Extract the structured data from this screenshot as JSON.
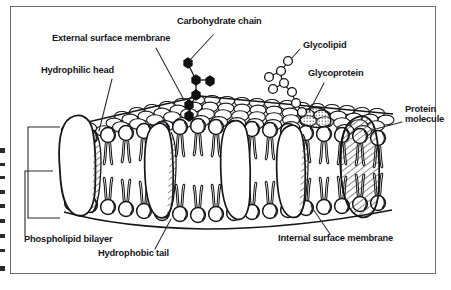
{
  "figure": {
    "type": "labelled-biology-diagram",
    "style": "black-and-white line drawing with cross-hatching, enclosed in a thin rectangular frame"
  },
  "colors": {
    "ink": "#15161a",
    "paper": "#ffffff",
    "frame": "#6d6d70",
    "leader_line": "#2b2b2e",
    "carbohydrate_fill": "#101012",
    "glycolipid_fill": "#ffffff",
    "hatch": "#3a3a3d"
  },
  "labels": [
    {
      "id": "carbohydrate-chain",
      "text": "Carbohydrate chain",
      "x": 177,
      "y": 21,
      "leader": {
        "from": [
          215,
          35
        ],
        "to": [
          189,
          62
        ]
      },
      "points_to": "branched chain of filled black hexagons projecting from the external surface"
    },
    {
      "id": "external-surface-membrane",
      "text": "External surface membrane",
      "x": 52,
      "y": 38,
      "leader": {
        "from": [
          155,
          50
        ],
        "to": [
          182,
          100
        ]
      },
      "points_to": "upper cobbled surface of phospholipid heads"
    },
    {
      "id": "glycolipid",
      "text": "Glycolipid",
      "x": 302,
      "y": 45,
      "leader": {
        "from": [
          300,
          53
        ],
        "to": [
          288,
          62
        ]
      },
      "points_to": "branched chain of open circles attached to a lipid"
    },
    {
      "id": "hydrophilic-head",
      "text": "Hydrophilic head",
      "x": 41,
      "y": 70,
      "leader": {
        "from": [
          110,
          79
        ],
        "to": [
          100,
          132
        ]
      },
      "points_to": "spherical head of a phospholipid in the outer leaflet"
    },
    {
      "id": "glycoprotein",
      "text": "Glycoprotein",
      "x": 307,
      "y": 73,
      "leader": {
        "from": [
          323,
          83
        ],
        "to": [
          304,
          112
        ]
      },
      "points_to": "stippled protein bump on the external surface"
    },
    {
      "id": "protein-molecule",
      "text": "Protein\nmolecule",
      "x": 405,
      "y": 110,
      "leader": {
        "from": [
          403,
          123
        ],
        "to": [
          372,
          132
        ]
      },
      "points_to": "large hatched protein spanning the bilayer at the right edge"
    },
    {
      "id": "phospholipid-bilayer",
      "text": "Phospholipid bilayer",
      "x": 24,
      "y": 239,
      "leader": {
        "from": [
          54,
          238
        ],
        "to": [
          54,
          170
        ]
      },
      "points_to": "bracketed full thickness of the two phospholipid leaflets"
    },
    {
      "id": "hydrophobic-tail",
      "text": "Hydrophobic tail",
      "x": 98,
      "y": 253,
      "leader": {
        "from": [
          156,
          250
        ],
        "to": [
          172,
          218
        ]
      },
      "points_to": "wavy fatty-acid tails in the membrane interior"
    },
    {
      "id": "internal-surface-membrane",
      "text": "Internal surface membrane",
      "x": 278,
      "y": 238,
      "leader": {
        "from": [
          330,
          236
        ],
        "to": [
          310,
          205
        ]
      },
      "points_to": "lower row of phospholipid heads facing the cytoplasm"
    }
  ],
  "structures": {
    "bilayer": {
      "leaflets": 2,
      "head_shape": "sphere with crescent shading",
      "tail_shape": "paired wavy lines"
    },
    "proteins": [
      {
        "id": "protein-left",
        "kind": "intrinsic",
        "position": "left",
        "shading": "outline"
      },
      {
        "id": "protein-mid-a",
        "kind": "intrinsic",
        "position": "centre-left",
        "shading": "outline"
      },
      {
        "id": "protein-mid-b",
        "kind": "intrinsic",
        "position": "centre",
        "shading": "outline"
      },
      {
        "id": "protein-mid-c",
        "kind": "intrinsic",
        "position": "centre-right",
        "shading": "outline"
      },
      {
        "id": "protein-right",
        "kind": "intrinsic",
        "position": "right",
        "shading": "hatched"
      }
    ],
    "carbohydrate_chain": {
      "units": 8,
      "fill": "solid-black",
      "shape": "hexagon"
    },
    "glycolipid_chain": {
      "units": 9,
      "fill": "white",
      "shape": "circle"
    },
    "bracket": {
      "id": "bilayer-bracket",
      "orientation": "vertical",
      "side": "left"
    }
  }
}
